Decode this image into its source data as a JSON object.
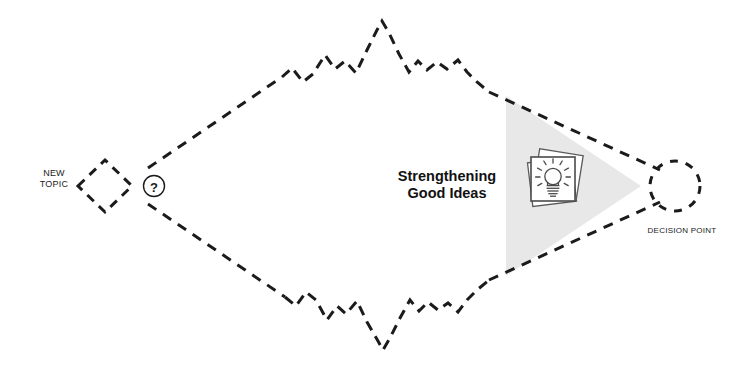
{
  "diagram": {
    "title_text": "Strengthening\nGood Ideas",
    "start_label": "NEW\nTOPIC",
    "end_label": "DECISION POINT",
    "question_glyph": "?",
    "colors": {
      "stroke": "#1b1b1b",
      "background": "#ffffff",
      "highlight_fill": "#e8e8e8",
      "icon_stroke": "#4a4a4a",
      "icon_fill": "#ffffff"
    },
    "nodes": [
      {
        "id": "new-topic-node",
        "shape": "dashed-diamond",
        "label": "NEW\nTOPIC"
      },
      {
        "id": "question-node",
        "shape": "circle",
        "label": "?"
      },
      {
        "id": "decision-point-node",
        "shape": "dashed-circle",
        "label": "DECISION POINT"
      }
    ],
    "paths": [
      {
        "id": "upper-divergence-path",
        "style": "dashed-straight",
        "direction": "up-right"
      },
      {
        "id": "upper-exploration-path",
        "style": "dashed-zigzag",
        "direction": "peak"
      },
      {
        "id": "upper-convergence-path",
        "style": "dashed-straight",
        "direction": "down-right"
      },
      {
        "id": "lower-divergence-path",
        "style": "dashed-straight",
        "direction": "down-right"
      },
      {
        "id": "lower-exploration-path",
        "style": "dashed-zigzag",
        "direction": "valley"
      },
      {
        "id": "lower-convergence-path",
        "style": "dashed-straight",
        "direction": "up-right"
      }
    ],
    "highlight_region": {
      "id": "convergence-zone",
      "shape": "triangle",
      "fill": "#e8e8e8"
    },
    "icon": {
      "id": "lightbulb-cards-icon",
      "name": "lightbulb-on-cards",
      "description": "stack of cards with a lightbulb"
    }
  }
}
